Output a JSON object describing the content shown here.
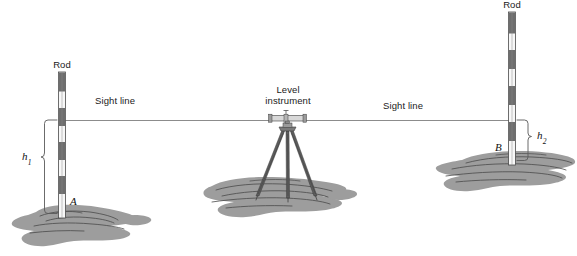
{
  "figure": {
    "width": 577,
    "height": 256,
    "background_color": "#ffffff"
  },
  "colors": {
    "rod_band_dark": "#6e6e6e",
    "rod_band_light": "#f7f7f7",
    "rod_outline": "#4a4a4a",
    "ground_fill": "#9d9d9d",
    "ground_detail": "#4a4a4a",
    "sight_line": "#8c8c8c",
    "bracket": "#5a5a5a",
    "instrument_body": "#d8d8d8",
    "instrument_dark": "#6a6a6a",
    "tripod_leg": "#555555",
    "text": "#1a1a1a"
  },
  "labels": {
    "rod_left": "Rod",
    "rod_right": "Rod",
    "sight_line_left": "Sight line",
    "sight_line_right": "Sight line",
    "level_instrument_line1": "Level",
    "level_instrument_line2": "instrument",
    "point_a": "A",
    "point_b": "B",
    "height_1": "h",
    "height_1_sub": "1",
    "height_2": "h",
    "height_2_sub": "2"
  },
  "geometry": {
    "sight_line_y": 120,
    "sight_line_x_start": 62,
    "sight_line_x_end": 513,
    "left_rod": {
      "x": 62,
      "top_y": 72,
      "bottom_y": 218,
      "width": 7,
      "band_count": 9
    },
    "right_rod": {
      "x": 512,
      "top_y": 12,
      "bottom_y": 165,
      "width": 7,
      "band_count": 9
    },
    "instrument": {
      "x": 287,
      "head_y": 120,
      "foot_y": 196
    },
    "bracket_h1": {
      "x": 44,
      "top_y": 120,
      "bottom_y": 214
    },
    "bracket_h2": {
      "x": 528,
      "top_y": 120,
      "bottom_y": 161
    }
  },
  "elements": [
    {
      "name": "left-rod",
      "type": "graduated-leveling-rod",
      "at_point": "A"
    },
    {
      "name": "right-rod",
      "type": "graduated-leveling-rod",
      "at_point": "B"
    },
    {
      "name": "level-instrument",
      "type": "tripod-mounted-level"
    },
    {
      "name": "sight-line",
      "type": "horizontal-line-of-sight"
    },
    {
      "name": "ground-left",
      "type": "terrain-patch"
    },
    {
      "name": "ground-center",
      "type": "terrain-patch"
    },
    {
      "name": "ground-right",
      "type": "terrain-patch"
    }
  ]
}
